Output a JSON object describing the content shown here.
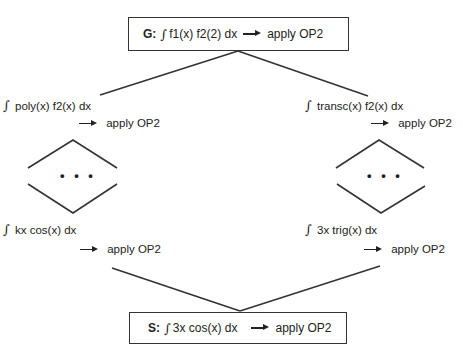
{
  "top_node": {
    "tag": "G:",
    "integral_symbol": "∫",
    "expression": "f1(x) f2(2) dx",
    "action": "apply OP2"
  },
  "left_branch": {
    "first": {
      "integral_symbol": "∫",
      "expression": "poly(x) f2(x) dx",
      "action": "apply OP2"
    },
    "ellipsis": "• • •",
    "last": {
      "integral_symbol": "∫",
      "expression": "kx cos(x) dx",
      "action": "apply OP2"
    }
  },
  "right_branch": {
    "first": {
      "integral_symbol": "∫",
      "expression": "transc(x) f2(x) dx",
      "action": "apply OP2"
    },
    "ellipsis": "• • •",
    "last": {
      "integral_symbol": "∫",
      "expression": "3x trig(x) dx",
      "action": "apply OP2"
    }
  },
  "bottom_node": {
    "tag": "S:",
    "integral_symbol": "∫",
    "expression": "3x cos(x) dx",
    "action": "apply OP2"
  },
  "colors": {
    "line": "#333333",
    "text": "#222222",
    "background": "#ffffff"
  }
}
